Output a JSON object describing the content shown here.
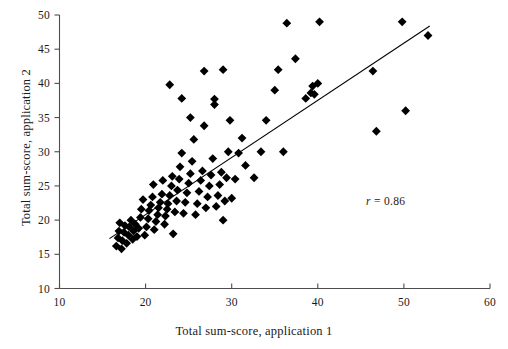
{
  "chart_data": {
    "type": "scatter",
    "title": "",
    "xlabel": "Total sum-score, application 1",
    "ylabel": "Total sum-score, application 2",
    "xlim": [
      10,
      60
    ],
    "ylim": [
      10,
      50
    ],
    "xticks": [
      10,
      20,
      30,
      40,
      50,
      60
    ],
    "yticks": [
      10,
      15,
      20,
      25,
      30,
      35,
      40,
      45,
      50
    ],
    "grid": false,
    "legend": null,
    "marker": "diamond",
    "marker_color": "#000000",
    "annotations": [
      {
        "name": "correlation",
        "text": "r = 0.86",
        "symbol": "r",
        "operator": "=",
        "value": "0.86",
        "x": 46.5,
        "y": 23.0
      }
    ],
    "fit_line": {
      "name": "regression-line",
      "color": "#000000",
      "x_start": 15.8,
      "y_start": 17.3,
      "x_end": 53.0,
      "y_end": 48.4
    },
    "points": [
      [
        16.6,
        16.2
      ],
      [
        16.8,
        17.4
      ],
      [
        16.9,
        18.4
      ],
      [
        17.0,
        19.6
      ],
      [
        17.2,
        15.8
      ],
      [
        17.3,
        17.0
      ],
      [
        17.5,
        18.2
      ],
      [
        17.6,
        19.2
      ],
      [
        17.8,
        16.6
      ],
      [
        18.0,
        17.8
      ],
      [
        18.1,
        19.0
      ],
      [
        18.3,
        20.0
      ],
      [
        18.5,
        17.2
      ],
      [
        18.6,
        18.4
      ],
      [
        18.8,
        19.4
      ],
      [
        19.0,
        17.6
      ],
      [
        19.2,
        18.8
      ],
      [
        19.4,
        20.4
      ],
      [
        19.5,
        21.6
      ],
      [
        19.7,
        23.0
      ],
      [
        19.9,
        17.8
      ],
      [
        20.1,
        19.0
      ],
      [
        20.3,
        20.2
      ],
      [
        20.4,
        21.4
      ],
      [
        20.6,
        22.2
      ],
      [
        20.8,
        23.4
      ],
      [
        20.9,
        25.2
      ],
      [
        21.0,
        18.6
      ],
      [
        21.2,
        19.8
      ],
      [
        21.4,
        20.8
      ],
      [
        21.5,
        21.8
      ],
      [
        21.7,
        22.6
      ],
      [
        21.9,
        23.8
      ],
      [
        22.0,
        25.8
      ],
      [
        22.2,
        19.4
      ],
      [
        22.3,
        20.6
      ],
      [
        22.5,
        21.6
      ],
      [
        22.6,
        22.4
      ],
      [
        22.8,
        23.6
      ],
      [
        23.0,
        25.0
      ],
      [
        23.1,
        26.4
      ],
      [
        23.2,
        18.0
      ],
      [
        23.4,
        21.2
      ],
      [
        23.6,
        22.8
      ],
      [
        23.7,
        24.4
      ],
      [
        23.9,
        26.0
      ],
      [
        24.0,
        27.8
      ],
      [
        24.2,
        29.8
      ],
      [
        24.4,
        21.0
      ],
      [
        24.6,
        22.6
      ],
      [
        24.8,
        24.0
      ],
      [
        25.0,
        25.4
      ],
      [
        25.2,
        26.8
      ],
      [
        25.4,
        28.6
      ],
      [
        25.6,
        31.8
      ],
      [
        25.8,
        20.8
      ],
      [
        26.0,
        22.4
      ],
      [
        26.2,
        24.2
      ],
      [
        26.4,
        25.8
      ],
      [
        26.6,
        27.2
      ],
      [
        26.8,
        33.8
      ],
      [
        27.0,
        21.8
      ],
      [
        27.2,
        23.4
      ],
      [
        27.4,
        25.0
      ],
      [
        27.6,
        26.6
      ],
      [
        27.8,
        29.0
      ],
      [
        28.0,
        37.7
      ],
      [
        28.2,
        22.0
      ],
      [
        28.4,
        23.6
      ],
      [
        28.6,
        25.2
      ],
      [
        28.8,
        27.0
      ],
      [
        29.0,
        20.0
      ],
      [
        29.2,
        22.8
      ],
      [
        29.4,
        26.2
      ],
      [
        29.6,
        30.0
      ],
      [
        29.8,
        34.6
      ],
      [
        30.0,
        23.2
      ],
      [
        30.4,
        26.0
      ],
      [
        30.8,
        29.8
      ],
      [
        22.8,
        39.8
      ],
      [
        24.2,
        37.8
      ],
      [
        25.2,
        35.0
      ],
      [
        26.8,
        41.8
      ],
      [
        28.0,
        36.9
      ],
      [
        29.0,
        42.0
      ],
      [
        31.2,
        32.0
      ],
      [
        31.6,
        28.0
      ],
      [
        32.6,
        26.2
      ],
      [
        33.4,
        30.0
      ],
      [
        34.0,
        34.6
      ],
      [
        35.0,
        39.0
      ],
      [
        35.4,
        42.0
      ],
      [
        36.0,
        30.0
      ],
      [
        36.4,
        48.8
      ],
      [
        37.4,
        43.6
      ],
      [
        38.6,
        37.8
      ],
      [
        39.2,
        38.6
      ],
      [
        39.4,
        39.6
      ],
      [
        39.6,
        38.4
      ],
      [
        40.0,
        40.0
      ],
      [
        40.2,
        49.0
      ],
      [
        46.4,
        41.8
      ],
      [
        46.8,
        33.0
      ],
      [
        49.8,
        49.0
      ],
      [
        50.2,
        36.0
      ],
      [
        52.8,
        47.0
      ]
    ]
  },
  "axes": {
    "x_ticks_text": [
      "10",
      "20",
      "30",
      "40",
      "50",
      "60"
    ],
    "y_ticks_text": [
      "10",
      "15",
      "20",
      "25",
      "30",
      "35",
      "40",
      "45",
      "50"
    ]
  }
}
